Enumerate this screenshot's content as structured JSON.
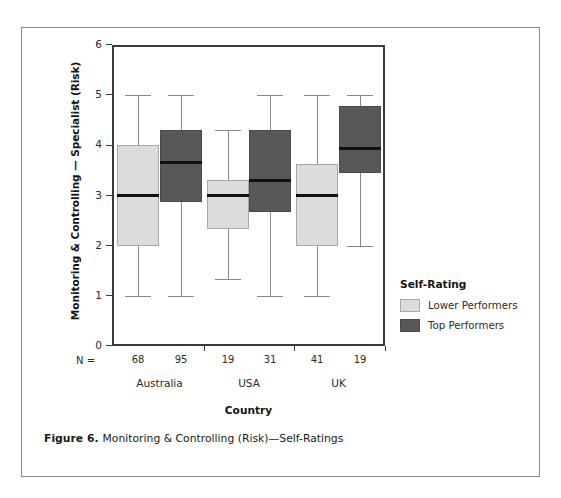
{
  "caption": {
    "label": "Figure 6.",
    "text": "Monitoring & Controlling (Risk)—Self-Ratings"
  },
  "legend": {
    "title": "Self-Rating",
    "entries": [
      {
        "label": "Lower Performers",
        "color": "#dcdcdc"
      },
      {
        "label": "Top Performers",
        "color": "#585858"
      }
    ]
  },
  "axis": {
    "n_prefix": "N =",
    "y_ticks": [
      "0",
      "1",
      "2",
      "3",
      "4",
      "5",
      "6"
    ]
  },
  "chart_data": {
    "type": "box",
    "title": "Monitoring & Controlling (Risk)—Self-Ratings",
    "xlabel": "Country",
    "ylabel": "Monitoring & Controlling — Specialist (Risk)",
    "ylim": [
      0,
      6
    ],
    "yticks": [
      0,
      1,
      2,
      3,
      4,
      5,
      6
    ],
    "grid": false,
    "legend_title": "Self-Rating",
    "legend_position": "right",
    "categories": [
      "Australia",
      "USA",
      "UK"
    ],
    "series": [
      {
        "name": "Lower Performers",
        "color": "#dcdcdc",
        "boxes": [
          {
            "category": "Australia",
            "n": 68,
            "whisker_low": 1.0,
            "q1": 2.0,
            "median": 3.0,
            "q3": 4.0,
            "whisker_high": 5.0
          },
          {
            "category": "USA",
            "n": 19,
            "whisker_low": 1.33,
            "q1": 2.33,
            "median": 3.0,
            "q3": 3.3,
            "whisker_high": 4.3
          },
          {
            "category": "UK",
            "n": 41,
            "whisker_low": 1.0,
            "q1": 2.0,
            "median": 3.0,
            "q3": 3.62,
            "whisker_high": 5.0
          }
        ]
      },
      {
        "name": "Top Performers",
        "color": "#585858",
        "boxes": [
          {
            "category": "Australia",
            "n": 95,
            "whisker_low": 1.0,
            "q1": 2.87,
            "median": 3.65,
            "q3": 4.3,
            "whisker_high": 5.0
          },
          {
            "category": "USA",
            "n": 31,
            "whisker_low": 1.0,
            "q1": 2.67,
            "median": 3.3,
            "q3": 4.3,
            "whisker_high": 5.0
          },
          {
            "category": "UK",
            "n": 19,
            "whisker_low": 2.0,
            "q1": 3.45,
            "median": 3.93,
            "q3": 4.78,
            "whisker_high": 5.0
          }
        ]
      }
    ],
    "n_labels": [
      "68",
      "95",
      "19",
      "31",
      "41",
      "19"
    ]
  }
}
